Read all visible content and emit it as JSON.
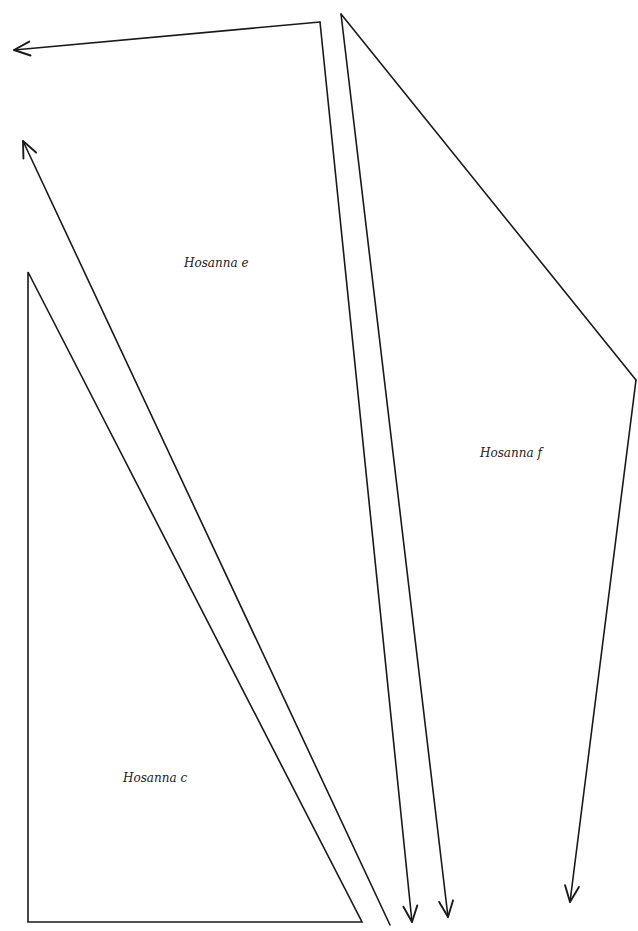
{
  "diagram": {
    "stroke_color": "#1a1a1a",
    "stroke_width": 1.6,
    "labels": [
      {
        "id": "hosanna-e",
        "text": "Hosanna e",
        "x": 184,
        "y": 264
      },
      {
        "id": "hosanna-f",
        "text": "Hosanna f",
        "x": 480,
        "y": 454
      },
      {
        "id": "hosanna-c",
        "text": "Hosanna c",
        "x": 123,
        "y": 779
      }
    ],
    "shapes": [
      {
        "id": "triangle-c",
        "type": "polygon",
        "points": [
          [
            28,
            272
          ],
          [
            28,
            922
          ],
          [
            362,
            922
          ]
        ]
      },
      {
        "id": "arrow-e-diagonal",
        "type": "arrow",
        "from": [
          390,
          925
        ],
        "to": [
          23,
          141
        ]
      },
      {
        "id": "line-e-top",
        "type": "line",
        "from": [
          320,
          22
        ],
        "to": [
          14,
          50
        ],
        "arrow_end": true
      },
      {
        "id": "arrow-e-vertical",
        "type": "arrow",
        "from": [
          320,
          22
        ],
        "to": [
          412,
          922
        ]
      },
      {
        "id": "arrow-f-vertical",
        "type": "arrow",
        "from": [
          341,
          14
        ],
        "to": [
          448,
          917
        ]
      },
      {
        "id": "line-f-diagonal",
        "type": "line",
        "from": [
          341,
          14
        ],
        "to": [
          636,
          380
        ],
        "arrow_end": false
      },
      {
        "id": "arrow-f-right",
        "type": "arrow",
        "from": [
          636,
          380
        ],
        "to": [
          570,
          902
        ]
      }
    ]
  }
}
